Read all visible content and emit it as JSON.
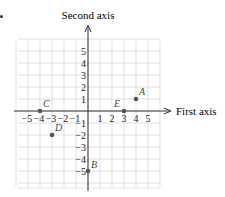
{
  "chart_data": {
    "type": "scatter",
    "title": "",
    "xlabel": "First axis",
    "ylabel": "Second axis",
    "xlim": [
      -6,
      6
    ],
    "ylim": [
      -6,
      6
    ],
    "grid": true,
    "x_ticks": [
      -5,
      -4,
      -3,
      -2,
      -1,
      1,
      2,
      3,
      4,
      5
    ],
    "y_ticks": [
      -5,
      -4,
      -3,
      -2,
      -1,
      1,
      2,
      3,
      4,
      5
    ],
    "points": [
      {
        "label": "A",
        "x": 4,
        "y": 1
      },
      {
        "label": "B",
        "x": 0,
        "y": -5
      },
      {
        "label": "C",
        "x": -4,
        "y": 0
      },
      {
        "label": "D",
        "x": -3,
        "y": -2
      },
      {
        "label": "E",
        "x": 3,
        "y": 0
      }
    ]
  },
  "style": {
    "grid_color": "#d9d9d9",
    "axis_color": "#333333",
    "point_color": "#555555",
    "label_color": "#444444",
    "text_color": "#222222"
  },
  "layout": {
    "origin_x": 88,
    "origin_y": 111,
    "unit": 12
  }
}
